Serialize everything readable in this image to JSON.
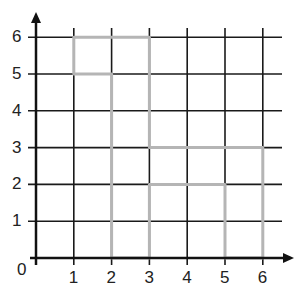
{
  "diagram": {
    "type": "grid-shape",
    "x_ticks": [
      "1",
      "2",
      "3",
      "4",
      "5",
      "6"
    ],
    "y_ticks": [
      "1",
      "2",
      "3",
      "4",
      "5",
      "6"
    ],
    "origin_label": "0",
    "x_range": [
      0,
      6
    ],
    "y_range": [
      0,
      6
    ],
    "shape_vertices": [
      [
        1,
        6
      ],
      [
        3,
        6
      ],
      [
        3,
        3
      ],
      [
        6,
        3
      ],
      [
        6,
        0
      ],
      [
        5,
        0
      ],
      [
        5,
        2
      ],
      [
        3,
        2
      ],
      [
        3,
        0
      ],
      [
        2,
        0
      ],
      [
        2,
        5
      ],
      [
        1,
        5
      ]
    ],
    "colors": {
      "grid": "#1a1a1a",
      "shape": "#b5b5b5",
      "axis": "#111111"
    }
  }
}
